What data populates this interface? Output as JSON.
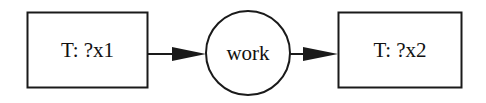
{
  "diagram": {
    "nodes": [
      {
        "id": "n1",
        "shape": "box",
        "label": "T: ?x1"
      },
      {
        "id": "n2",
        "shape": "circle",
        "label": "work"
      },
      {
        "id": "n3",
        "shape": "box",
        "label": "T: ?x2"
      }
    ],
    "edges": [
      {
        "from": "n1",
        "to": "n2"
      },
      {
        "from": "n2",
        "to": "n3"
      }
    ],
    "colors": {
      "stroke": "#1a1a1a",
      "background": "#ffffff"
    }
  }
}
